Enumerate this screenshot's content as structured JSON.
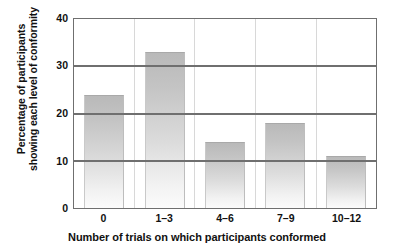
{
  "chart_data": {
    "type": "bar",
    "title": "",
    "categories": [
      "0",
      "1–3",
      "4–6",
      "7–9",
      "10–12"
    ],
    "values": [
      24,
      33,
      14,
      18,
      11
    ],
    "xlabel": "Number of trials on which participants conformed",
    "ylabel_line1": "Percentage of participants",
    "ylabel_line2": "showing each level of conformity",
    "ylim": [
      0,
      40
    ],
    "yticks": [
      "40",
      "30",
      "20",
      "10",
      "0"
    ],
    "ytick_values": [
      40,
      30,
      20,
      10,
      0
    ],
    "grid": true,
    "grid_axis": "y",
    "legend": "none",
    "bar_color_top": "#b9b9b9",
    "bar_color_bottom": "#fbfbfb",
    "axis_color": "#6f6f6f",
    "background": "#ffffff"
  }
}
